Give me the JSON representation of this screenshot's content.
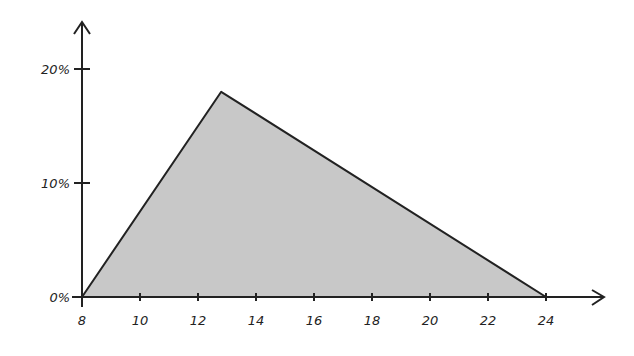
{
  "chart_data": {
    "type": "area",
    "title": "",
    "xlabel": "",
    "ylabel": "",
    "x": [
      8,
      12.8,
      24
    ],
    "values": [
      0,
      18,
      0
    ],
    "series": [
      {
        "name": "distribution",
        "x": [
          8,
          12.8,
          24
        ],
        "values": [
          0,
          18,
          0
        ]
      }
    ],
    "xticks": [
      "8",
      "10",
      "12",
      "14",
      "16",
      "18",
      "20",
      "22",
      "24"
    ],
    "yticks": [
      "0%",
      "10%",
      "20%"
    ],
    "xlim": [
      8,
      25.5
    ],
    "ylim": [
      0,
      24
    ],
    "grid": false,
    "legend": null,
    "fill_color": "#c8c8c8",
    "line_color": "#222222"
  }
}
